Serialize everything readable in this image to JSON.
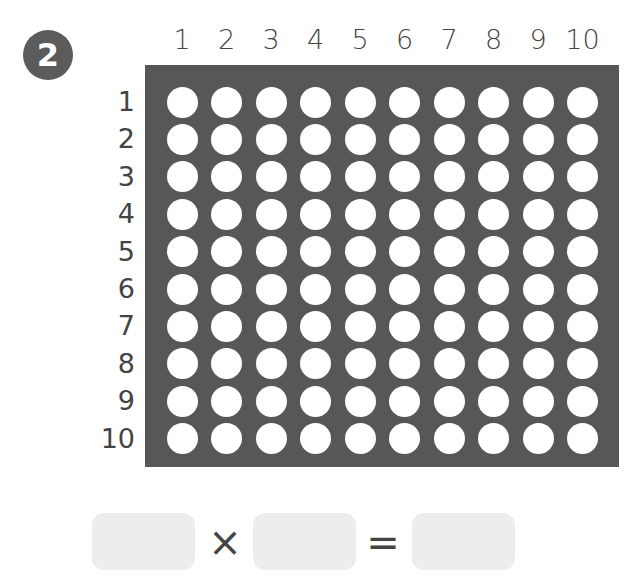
{
  "problem": {
    "number": "2"
  },
  "array": {
    "rows": 10,
    "cols": 10,
    "col_labels": [
      "1",
      "2",
      "3",
      "4",
      "5",
      "6",
      "7",
      "8",
      "9",
      "10"
    ],
    "row_labels": [
      "1",
      "2",
      "3",
      "4",
      "5",
      "6",
      "7",
      "8",
      "9",
      "10"
    ],
    "grid_color": "#575757",
    "dot_color": "#ffffff"
  },
  "equation": {
    "factor1": "",
    "operator": "×",
    "factor2": "",
    "equals": "=",
    "product": "",
    "box_color": "#ededed"
  }
}
